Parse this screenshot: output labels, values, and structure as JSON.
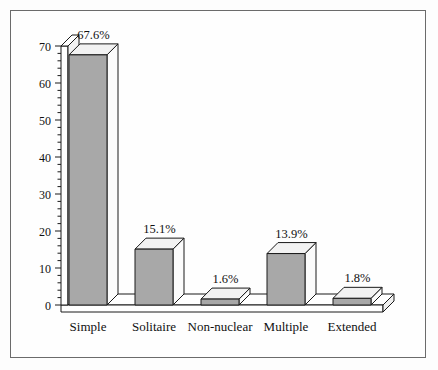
{
  "chart_data": {
    "type": "bar",
    "title": "",
    "subtitle": "",
    "xlabel": "",
    "ylabel": "",
    "categories": [
      "Simple",
      "Solitaire",
      "Non-nuclear",
      "Multiple",
      "Extended"
    ],
    "values": [
      67.6,
      15.1,
      1.6,
      13.9,
      1.8
    ],
    "data_labels": [
      "67.6%",
      "15.1%",
      "1.6%",
      "13.9%",
      "1.8%"
    ],
    "ylim": [
      0,
      70
    ],
    "y_ticks": [
      0,
      10,
      20,
      30,
      40,
      50,
      60,
      70
    ],
    "y_tick_labels": [
      "0",
      "10",
      "20",
      "30",
      "40",
      "50",
      "60",
      "70"
    ],
    "y_minor_tick_step": 2,
    "grid": false,
    "legend": null,
    "style": "3d-bar",
    "colors": {
      "bar_front": "#a8a8a8",
      "bar_top": "#f2f2f2",
      "bar_side": "#fbfbfb",
      "outline": "#1a1a1a",
      "axis": "#1a1a1a",
      "background": "#fefefe",
      "border": "#6b6b6b",
      "text": "#111111"
    }
  },
  "figure": {
    "border_present": true
  }
}
